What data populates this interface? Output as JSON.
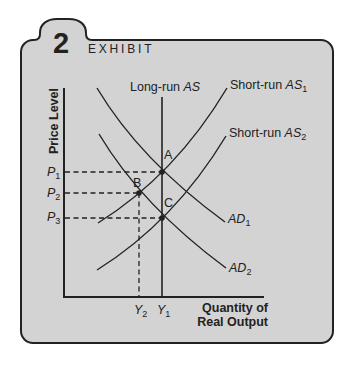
{
  "exhibit": {
    "number": "2",
    "label": "EXHIBIT"
  },
  "axes": {
    "y_label": "Price Level",
    "x_label_line1": "Quantity of",
    "x_label_line2": "Real Output"
  },
  "curve_labels": {
    "long_run_as": {
      "prefix": "Long-run ",
      "italic": "AS"
    },
    "short_run_as1": {
      "prefix": "Short-run ",
      "italic": "AS",
      "sub": "1"
    },
    "short_run_as2": {
      "prefix": "Short-run ",
      "italic": "AS",
      "sub": "2"
    },
    "ad1": {
      "italic": "AD",
      "sub": "1"
    },
    "ad2": {
      "italic": "AD",
      "sub": "2"
    }
  },
  "points": {
    "a": "A",
    "b": "B",
    "c": "C"
  },
  "price_ticks": [
    {
      "italic": "P",
      "sub": "1"
    },
    {
      "italic": "P",
      "sub": "2"
    },
    {
      "italic": "P",
      "sub": "3"
    }
  ],
  "output_ticks": [
    {
      "italic": "Y",
      "sub": "2"
    },
    {
      "italic": "Y",
      "sub": "1"
    }
  ],
  "colors": {
    "panel": "#d3d3d3",
    "ink": "#222222",
    "background": "#ffffff"
  },
  "diagram": {
    "type": "aggregate-supply-demand",
    "curves": [
      "Long-run AS",
      "Short-run AS1",
      "Short-run AS2",
      "AD1",
      "AD2"
    ],
    "equilibria": [
      {
        "point": "A",
        "price": "P1",
        "output": "Y1",
        "curves": [
          "AD1",
          "Short-run AS1",
          "Long-run AS"
        ]
      },
      {
        "point": "B",
        "price": "P2",
        "output": "Y2",
        "curves": [
          "AD2",
          "Short-run AS1"
        ]
      },
      {
        "point": "C",
        "price": "P3",
        "output": "Y1",
        "curves": [
          "AD2",
          "Short-run AS2",
          "Long-run AS"
        ]
      }
    ],
    "price_order": [
      "P1",
      "P2",
      "P3"
    ],
    "output_order": [
      "Y2",
      "Y1"
    ]
  }
}
